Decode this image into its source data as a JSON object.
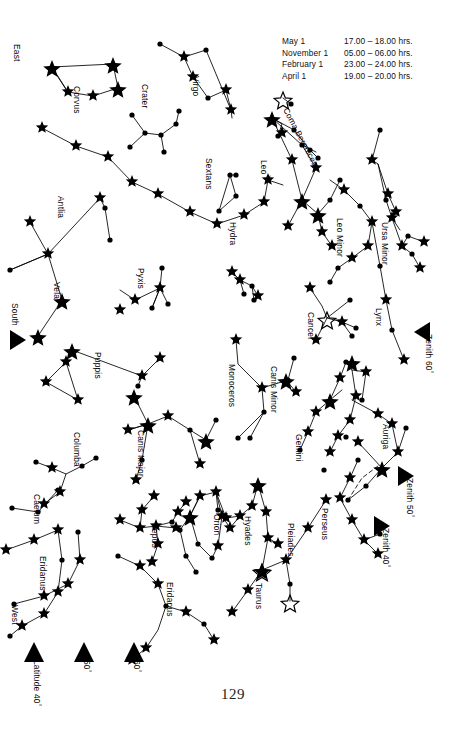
{
  "page": {
    "number": "129",
    "width": 466,
    "height": 742,
    "background": "#ffffff",
    "ink": "#000000"
  },
  "legend": {
    "rows": [
      {
        "date": "May 1",
        "time": "17.00 – 18.00 hrs."
      },
      {
        "date": "November 1",
        "time": "05.00 – 06.00 hrs."
      },
      {
        "date": "February 1",
        "time": "23.00 – 24.00 hrs."
      },
      {
        "date": "April 1",
        "time": "19.00 – 20.00 hrs."
      }
    ]
  },
  "edge_labels": [
    {
      "id": "east",
      "text": "East",
      "x": 20,
      "y": 44,
      "rot": 90
    },
    {
      "id": "south",
      "text": "South",
      "x": 18,
      "y": 305,
      "rot": 90
    },
    {
      "id": "west",
      "text": "West",
      "x": 18,
      "y": 608,
      "rot": 90
    }
  ],
  "markers": [
    {
      "id": "south-marker",
      "shape": "triangle-right",
      "x": 12,
      "y": 338,
      "label": "",
      "deg": ""
    },
    {
      "id": "zenith-60",
      "shape": "triangle-left",
      "x": 418,
      "y": 327,
      "label": "Zenith 60",
      "deg": "°",
      "tx": 433,
      "ty": 336,
      "rot": 90
    },
    {
      "id": "zenith-50",
      "shape": "triangle-right",
      "x": 399,
      "y": 471,
      "label": "Zenith 50",
      "deg": "°",
      "tx": 414,
      "ty": 480,
      "rot": 90
    },
    {
      "id": "zenith-40",
      "shape": "triangle-right",
      "x": 375,
      "y": 521,
      "label": "Zenith 40",
      "deg": "°",
      "tx": 390,
      "ty": 530,
      "rot": 90
    },
    {
      "id": "latitude-40",
      "shape": "triangle-up",
      "x": 24,
      "y": 648,
      "label": "Latitude 40",
      "deg": "°",
      "tx": 40,
      "ty": 659,
      "rot": 90
    },
    {
      "id": "latitude-50",
      "shape": "triangle-up",
      "x": 74,
      "y": 648,
      "label": "50",
      "deg": "°",
      "tx": 90,
      "ty": 659,
      "rot": 90
    },
    {
      "id": "latitude-60",
      "shape": "triangle-up",
      "x": 124,
      "y": 648,
      "label": "60",
      "deg": "°",
      "tx": 140,
      "ty": 659,
      "rot": 90
    }
  ],
  "constellation_labels": [
    {
      "name": "Corvus",
      "x": 82,
      "y": 86,
      "rot": 90
    },
    {
      "name": "Crater",
      "x": 150,
      "y": 84,
      "rot": 90
    },
    {
      "name": "Virgo",
      "x": 201,
      "y": 76,
      "rot": 90
    },
    {
      "name": "Coma Berenices",
      "x": 290,
      "y": 106,
      "rot": 62
    },
    {
      "name": "Sextans",
      "x": 214,
      "y": 158,
      "rot": 90
    },
    {
      "name": "Leo",
      "x": 269,
      "y": 160,
      "rot": 90
    },
    {
      "name": "Antlia",
      "x": 66,
      "y": 196,
      "rot": 90
    },
    {
      "name": "Hydra",
      "x": 238,
      "y": 222,
      "rot": 90
    },
    {
      "name": "Leo Minor",
      "x": 345,
      "y": 218,
      "rot": 90
    },
    {
      "name": "Ursa Minor",
      "x": 390,
      "y": 222,
      "rot": 90
    },
    {
      "name": "Pyxis",
      "x": 146,
      "y": 268,
      "rot": 90
    },
    {
      "name": "Vela",
      "x": 62,
      "y": 282,
      "rot": 90
    },
    {
      "name": "Cancer",
      "x": 316,
      "y": 312,
      "rot": 90
    },
    {
      "name": "Lynx",
      "x": 384,
      "y": 308,
      "rot": 90
    },
    {
      "name": "Puppis",
      "x": 103,
      "y": 352,
      "rot": 90
    },
    {
      "name": "Monoceros",
      "x": 237,
      "y": 364,
      "rot": 90
    },
    {
      "name": "Canis Minor",
      "x": 279,
      "y": 366,
      "rot": 90
    },
    {
      "name": "Auriga",
      "x": 391,
      "y": 424,
      "rot": 90
    },
    {
      "name": "Columba",
      "x": 82,
      "y": 432,
      "rot": 90
    },
    {
      "name": "Canis Major",
      "x": 146,
      "y": 430,
      "rot": 90
    },
    {
      "name": "Gemini",
      "x": 304,
      "y": 434,
      "rot": 90
    },
    {
      "name": "Caelum",
      "x": 42,
      "y": 494,
      "rot": 90
    },
    {
      "name": "Lepus",
      "x": 160,
      "y": 524,
      "rot": 90
    },
    {
      "name": "Orion",
      "x": 222,
      "y": 514,
      "rot": 90
    },
    {
      "name": "Hyades",
      "x": 253,
      "y": 516,
      "rot": 90
    },
    {
      "name": "Pleiades",
      "x": 296,
      "y": 523,
      "rot": 90
    },
    {
      "name": "Perseus",
      "x": 330,
      "y": 508,
      "rot": 90
    },
    {
      "name": "Taurus",
      "x": 264,
      "y": 583,
      "rot": 90
    },
    {
      "name": "Eridanus",
      "x": 48,
      "y": 556,
      "rot": 90
    },
    {
      "name": "Eridanus",
      "x": 175,
      "y": 582,
      "rot": 90
    }
  ],
  "chart_data": {
    "type": "scatter",
    "star_symbols": {
      "bright": "filled 5-point star, large",
      "medium": "filled 5-point star, small",
      "faint": "filled dot",
      "cluster": "open (outline) 5-point star"
    },
    "clusters": [
      {
        "name": "Coma Berenices cluster",
        "x": 283,
        "y": 98
      },
      {
        "name": "Praesepe (Cancer)",
        "x": 327,
        "y": 318
      },
      {
        "name": "Hyades",
        "x": 262,
        "y": 570
      },
      {
        "name": "Pleiades",
        "x": 290,
        "y": 601
      }
    ]
  }
}
